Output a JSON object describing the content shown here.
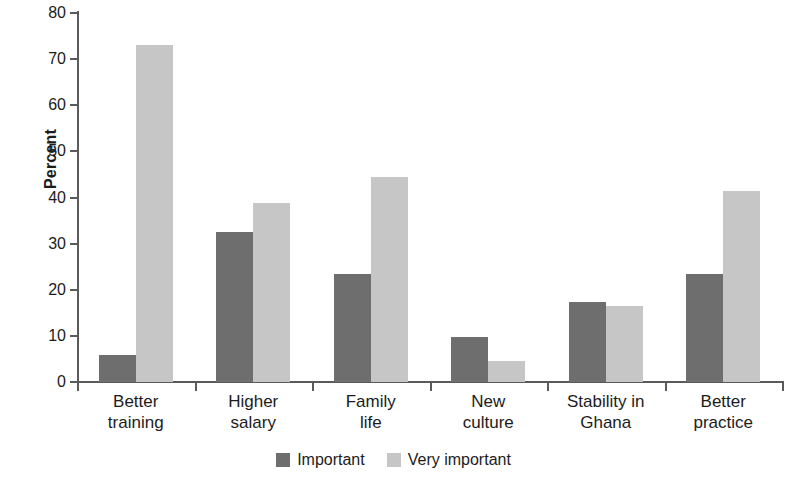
{
  "chart_data": {
    "type": "bar",
    "title": "",
    "xlabel": "",
    "ylabel": "Percent",
    "ylim": [
      0,
      80
    ],
    "yticks": [
      0,
      10,
      20,
      30,
      40,
      50,
      60,
      70,
      80
    ],
    "grid": false,
    "legend_position": "bottom",
    "categories": [
      "Better training",
      "Higher salary",
      "Family life",
      "New culture",
      "Stability in Ghana",
      "Better practice"
    ],
    "category_lines": [
      [
        "Better",
        "training"
      ],
      [
        "Higher",
        "salary"
      ],
      [
        "Family",
        "life"
      ],
      [
        "New",
        "culture"
      ],
      [
        "Stability in",
        "Ghana"
      ],
      [
        "Better",
        "practice"
      ]
    ],
    "series": [
      {
        "name": "Important",
        "color": "#6e6e6e",
        "values": [
          5.9,
          32.6,
          23.5,
          9.7,
          17.4,
          23.4
        ]
      },
      {
        "name": "Very important",
        "color": "#c6c6c6",
        "values": [
          73.0,
          38.9,
          44.5,
          4.6,
          16.5,
          41.4
        ]
      }
    ]
  },
  "axis": {
    "y_label": "Percent"
  },
  "legend": {
    "items": [
      {
        "label": "Important",
        "color": "#6e6e6e"
      },
      {
        "label": "Very important",
        "color": "#c6c6c6"
      }
    ]
  }
}
